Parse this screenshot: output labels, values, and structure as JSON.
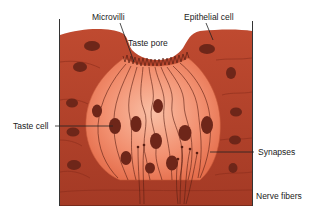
{
  "labels": {
    "microvilli": "Microvilli",
    "taste_pore": "Taste pore",
    "epithelial_cell": "Epithelial cell",
    "taste_cell": "Taste cell",
    "synapses": "Synapses",
    "nerve_fibers": "Nerve fibers"
  },
  "colors": {
    "tissue": "#b5412a",
    "tissue_dark": "#8e2f1e",
    "bud_light": "#f6ab8e",
    "bud_mid": "#ec7d5c",
    "nucleus": "#6b2418",
    "line": "#4a1a10",
    "frame": "#333333"
  }
}
